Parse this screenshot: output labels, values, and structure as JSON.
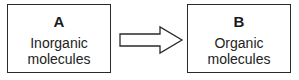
{
  "diagram": {
    "boxes": [
      {
        "id": "A",
        "label": "A",
        "line1": "Inorganic",
        "line2": "molecules"
      },
      {
        "id": "B",
        "label": "B",
        "line1": "Organic",
        "line2": "molecules"
      }
    ],
    "arrow": {
      "from": "A",
      "to": "B",
      "style": "hollow-block-arrow"
    }
  }
}
